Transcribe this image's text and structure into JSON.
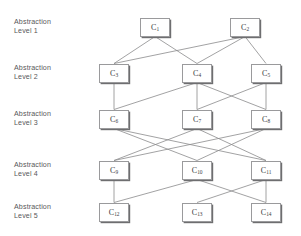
{
  "diagram": {
    "type": "layered-node-link-diagram",
    "width": 301,
    "height": 236,
    "background_color": "#ffffff",
    "node_border_color": "#9a9a9c",
    "node_shadow_color": "#6e6e70",
    "edge_color": "#8a8a8c",
    "label_color": "#58585a"
  },
  "levels": [
    {
      "id": "level-1",
      "label": "Abstraction\nLevel 1",
      "label_line1": "Abstraction",
      "label_line2": "Level 1",
      "y": 27
    },
    {
      "id": "level-2",
      "label": "Abstraction\nLevel 2",
      "label_line1": "Abstraction",
      "label_line2": "Level 2",
      "y": 73
    },
    {
      "id": "level-3",
      "label": "Abstraction\nLevel 3",
      "label_line1": "Abstraction",
      "label_line2": "Level 3",
      "y": 119
    },
    {
      "id": "level-4",
      "label": "Abstraction\nLevel 4",
      "label_line1": "Abstraction",
      "label_line2": "Level 4",
      "y": 170
    },
    {
      "id": "level-5",
      "label": "Abstraction\nLevel 5",
      "label_line1": "Abstraction",
      "label_line2": "Level 5",
      "y": 212
    }
  ],
  "nodes": [
    {
      "id": "C1",
      "base": "C",
      "sub": "1",
      "level": 1,
      "cx": 155,
      "cy": 27
    },
    {
      "id": "C2",
      "base": "C",
      "sub": "2",
      "level": 1,
      "cx": 245,
      "cy": 27
    },
    {
      "id": "C3",
      "base": "C",
      "sub": "3",
      "level": 2,
      "cx": 114,
      "cy": 73
    },
    {
      "id": "C4",
      "base": "C",
      "sub": "4",
      "level": 2,
      "cx": 197,
      "cy": 73
    },
    {
      "id": "C5",
      "base": "C",
      "sub": "5",
      "level": 2,
      "cx": 266,
      "cy": 73
    },
    {
      "id": "C6",
      "base": "C",
      "sub": "6",
      "level": 3,
      "cx": 114,
      "cy": 119
    },
    {
      "id": "C7",
      "base": "C",
      "sub": "7",
      "level": 3,
      "cx": 197,
      "cy": 119
    },
    {
      "id": "C8",
      "base": "C",
      "sub": "8",
      "level": 3,
      "cx": 266,
      "cy": 119
    },
    {
      "id": "C9",
      "base": "C",
      "sub": "9",
      "level": 4,
      "cx": 114,
      "cy": 170
    },
    {
      "id": "C10",
      "base": "C",
      "sub": "10",
      "level": 4,
      "cx": 197,
      "cy": 170
    },
    {
      "id": "C11",
      "base": "C",
      "sub": "11",
      "level": 4,
      "cx": 266,
      "cy": 170
    },
    {
      "id": "C12",
      "base": "C",
      "sub": "12",
      "level": 5,
      "cx": 114,
      "cy": 212
    },
    {
      "id": "C13",
      "base": "C",
      "sub": "13",
      "level": 5,
      "cx": 197,
      "cy": 212
    },
    {
      "id": "C14",
      "base": "C",
      "sub": "14",
      "level": 5,
      "cx": 266,
      "cy": 212
    }
  ],
  "node_size": {
    "width": 30,
    "height": 19
  },
  "edges": [
    {
      "from": "C1",
      "to": "C3"
    },
    {
      "from": "C1",
      "to": "C4"
    },
    {
      "from": "C2",
      "to": "C3"
    },
    {
      "from": "C2",
      "to": "C4"
    },
    {
      "from": "C2",
      "to": "C5"
    },
    {
      "from": "C3",
      "to": "C6"
    },
    {
      "from": "C4",
      "to": "C6"
    },
    {
      "from": "C4",
      "to": "C7"
    },
    {
      "from": "C4",
      "to": "C8"
    },
    {
      "from": "C5",
      "to": "C7"
    },
    {
      "from": "C5",
      "to": "C8"
    },
    {
      "from": "C6",
      "to": "C10"
    },
    {
      "from": "C6",
      "to": "C11"
    },
    {
      "from": "C7",
      "to": "C9"
    },
    {
      "from": "C7",
      "to": "C11"
    },
    {
      "from": "C8",
      "to": "C9"
    },
    {
      "from": "C8",
      "to": "C10"
    },
    {
      "from": "C9",
      "to": "C12"
    },
    {
      "from": "C10",
      "to": "C12"
    },
    {
      "from": "C10",
      "to": "C14"
    },
    {
      "from": "C11",
      "to": "C13"
    },
    {
      "from": "C11",
      "to": "C14"
    }
  ],
  "label_x": 14
}
